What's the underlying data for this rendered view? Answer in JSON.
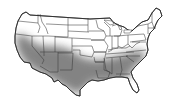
{
  "map": {
    "subject": "Contiguous United States",
    "depiction": "Shaded range map",
    "shaded_region_description": "Southern band: California, Nevada, Utah, Arizona, Colorado, New Mexico, Oklahoma, Texas, Arkansas, Louisiana, Mississippi, Alabama, Georgia, Tennessee, South Carolina, North Carolina, Florida",
    "shaded_states": [
      "CA",
      "NV",
      "UT",
      "AZ",
      "CO",
      "NM",
      "OK",
      "TX",
      "AR",
      "LA",
      "MS",
      "AL",
      "GA",
      "TN",
      "SC",
      "NC",
      "FL",
      "KY",
      "VA"
    ],
    "colors": {
      "background": "#ffffff",
      "border": "#333333",
      "shade_dark": "#6e6e6e",
      "shade_light": "#ffffff"
    }
  }
}
